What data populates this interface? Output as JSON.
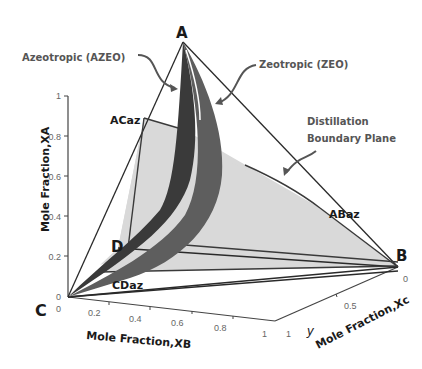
{
  "diagram": {
    "type": "3d-ternary-phase-diagram",
    "vertices": {
      "A": "A",
      "B": "B",
      "C": "C",
      "D": "D"
    },
    "azeotrope_points": {
      "ACaz": "ACaz",
      "ABaz": "ABaz",
      "CDaz": "CDaz"
    },
    "annotations": {
      "azeo": "Azeotropic (AZEO)",
      "zeo": "Zeotropic (ZEO)",
      "boundary_line1": "Distillation",
      "boundary_line2": "Boundary Plane"
    },
    "axes": {
      "z": {
        "title": "Mole Fraction,XA",
        "ticks": [
          "0",
          "0.2",
          "0.4",
          "0.6",
          "0.8",
          "1"
        ]
      },
      "x": {
        "title": "Mole Fraction,XB",
        "ticks": [
          "0",
          "0.2",
          "0.4",
          "0.6",
          "0.8",
          "1"
        ]
      },
      "y": {
        "title": "Mole Fraction,Xc",
        "ticks": [
          "1",
          "0.5",
          "0"
        ],
        "symbol": "y"
      }
    },
    "colors": {
      "boundary_plane": "#d9d9d9",
      "azeo_surface": "#3a3a3a",
      "zeo_surface": "#5e5e5e",
      "edges": "#2a2a2a"
    }
  }
}
